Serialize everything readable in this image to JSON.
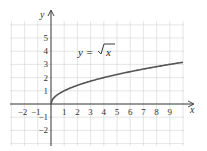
{
  "chart_data": {
    "type": "line",
    "title": "",
    "annotation": "y = √x",
    "xlabel": "x",
    "ylabel": "y",
    "xlim": [
      -3,
      10
    ],
    "ylim": [
      -3,
      6
    ],
    "grid": true,
    "x_ticks": [
      -2,
      -1,
      1,
      2,
      3,
      4,
      5,
      6,
      7,
      8,
      9
    ],
    "y_ticks": [
      -2,
      -1,
      1,
      2,
      3,
      4,
      5
    ],
    "series": [
      {
        "name": "y = √x",
        "x": [
          0,
          0.25,
          1,
          2,
          3,
          4,
          5,
          6,
          7,
          8,
          9,
          10
        ],
        "y": [
          0,
          0.5,
          1,
          1.414,
          1.732,
          2,
          2.236,
          2.449,
          2.646,
          2.828,
          3,
          3.162
        ]
      }
    ]
  },
  "labels": {
    "x_axis": "x",
    "y_axis": "y",
    "equation_lhs": "y =",
    "equation_rhs": "x"
  }
}
